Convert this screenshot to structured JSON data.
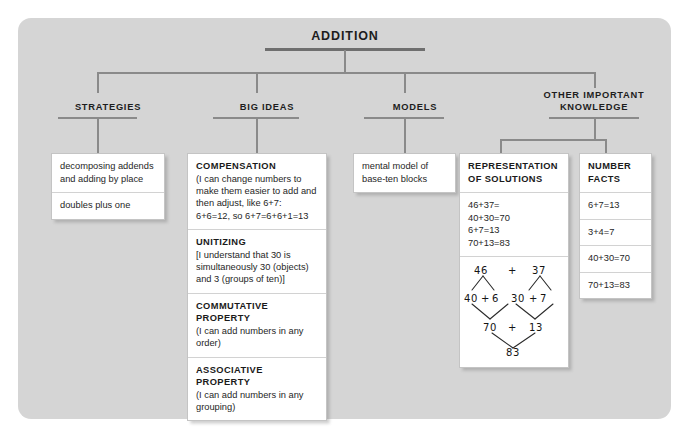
{
  "diagram": {
    "root": {
      "label": "ADDITION"
    },
    "columns": [
      {
        "id": "strategies",
        "label": "STRATEGIES"
      },
      {
        "id": "big-ideas",
        "label": "BIG IDEAS"
      },
      {
        "id": "models",
        "label": "MODELS"
      },
      {
        "id": "other-important-knowledge",
        "label": "OTHER IMPORTANT\nKNOWLEDGE",
        "line1": "OTHER IMPORTANT",
        "line2": "KNOWLEDGE"
      }
    ],
    "strategies": {
      "items": [
        {
          "text": "decomposing addends and adding by place"
        },
        {
          "text": "doubles plus one"
        }
      ]
    },
    "big_ideas": {
      "items": [
        {
          "heading": "COMPENSATION",
          "body": "(I can change numbers to make them easier to add and then adjust, like 6+7: 6+6=12, so 6+7=6+6+1=13"
        },
        {
          "heading": "UNITIZING",
          "body": "[I understand that 30 is simultaneously 30 (objects) and 3 (groups of ten)]"
        },
        {
          "heading": "COMMUTATIVE PROPERTY",
          "body": "(I can add numbers in any order)"
        },
        {
          "heading": "ASSOCIATIVE PROPERTY",
          "body": "(I can add numbers in any grouping)"
        }
      ]
    },
    "models": {
      "items": [
        {
          "text": "mental model of base-ten blocks"
        }
      ]
    },
    "representation_of_solutions": {
      "heading_line1": "REPRESENTATION",
      "heading_line2": "OF SOLUTIONS",
      "equations": [
        "46+37=",
        "40+30=70",
        "6+7=13",
        "70+13=83"
      ],
      "decomposition_tree": {
        "top": {
          "left": "46",
          "operator": "+",
          "right": "37"
        },
        "middle": {
          "left_a": "40",
          "left_op": "+",
          "left_b": "6",
          "right_a": "30",
          "right_op": "+",
          "right_b": "7"
        },
        "lower": {
          "left": "70",
          "operator": "+",
          "right": "13"
        },
        "result": "83"
      }
    },
    "number_facts": {
      "heading_line1": "NUMBER",
      "heading_line2": "FACTS",
      "facts": [
        "6+7=13",
        "3+4=7",
        "40+30=70",
        "70+13=83"
      ]
    },
    "colors": {
      "panel_background": "#d5d5d5",
      "page_background": "#ffffff",
      "box_background": "#ffffff",
      "box_border": "#c4c4c4",
      "connector": "#8a8a8a",
      "root_rule": "#6f6f6f",
      "text": "#1d1d1d"
    }
  }
}
